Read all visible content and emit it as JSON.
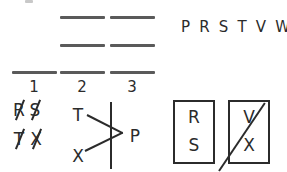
{
  "worksheet": {
    "alphabet_strip": "P R S T V W X",
    "columns": [
      {
        "number": "1",
        "blank_count": 1
      },
      {
        "number": "2",
        "blank_count": 3
      },
      {
        "number": "3",
        "blank_count": 3
      }
    ],
    "scratch_work": {
      "rows": [
        {
          "letters": [
            "R",
            "S"
          ],
          "struck_out": true
        },
        {
          "letters": [
            "T",
            "X"
          ],
          "struck_out": true
        }
      ]
    },
    "arrow_diagram": {
      "top_left_letter": "T",
      "bottom_left_letter": "X",
      "right_letter": "P"
    },
    "letter_boxes": [
      {
        "top": "R",
        "bottom": "S",
        "struck_out": false
      },
      {
        "top": "V",
        "bottom": "X",
        "struck_out": true
      }
    ]
  },
  "colors": {
    "ink": "#2b2b2b",
    "rule_line": "#5a5a5a",
    "background": "#ffffff"
  }
}
